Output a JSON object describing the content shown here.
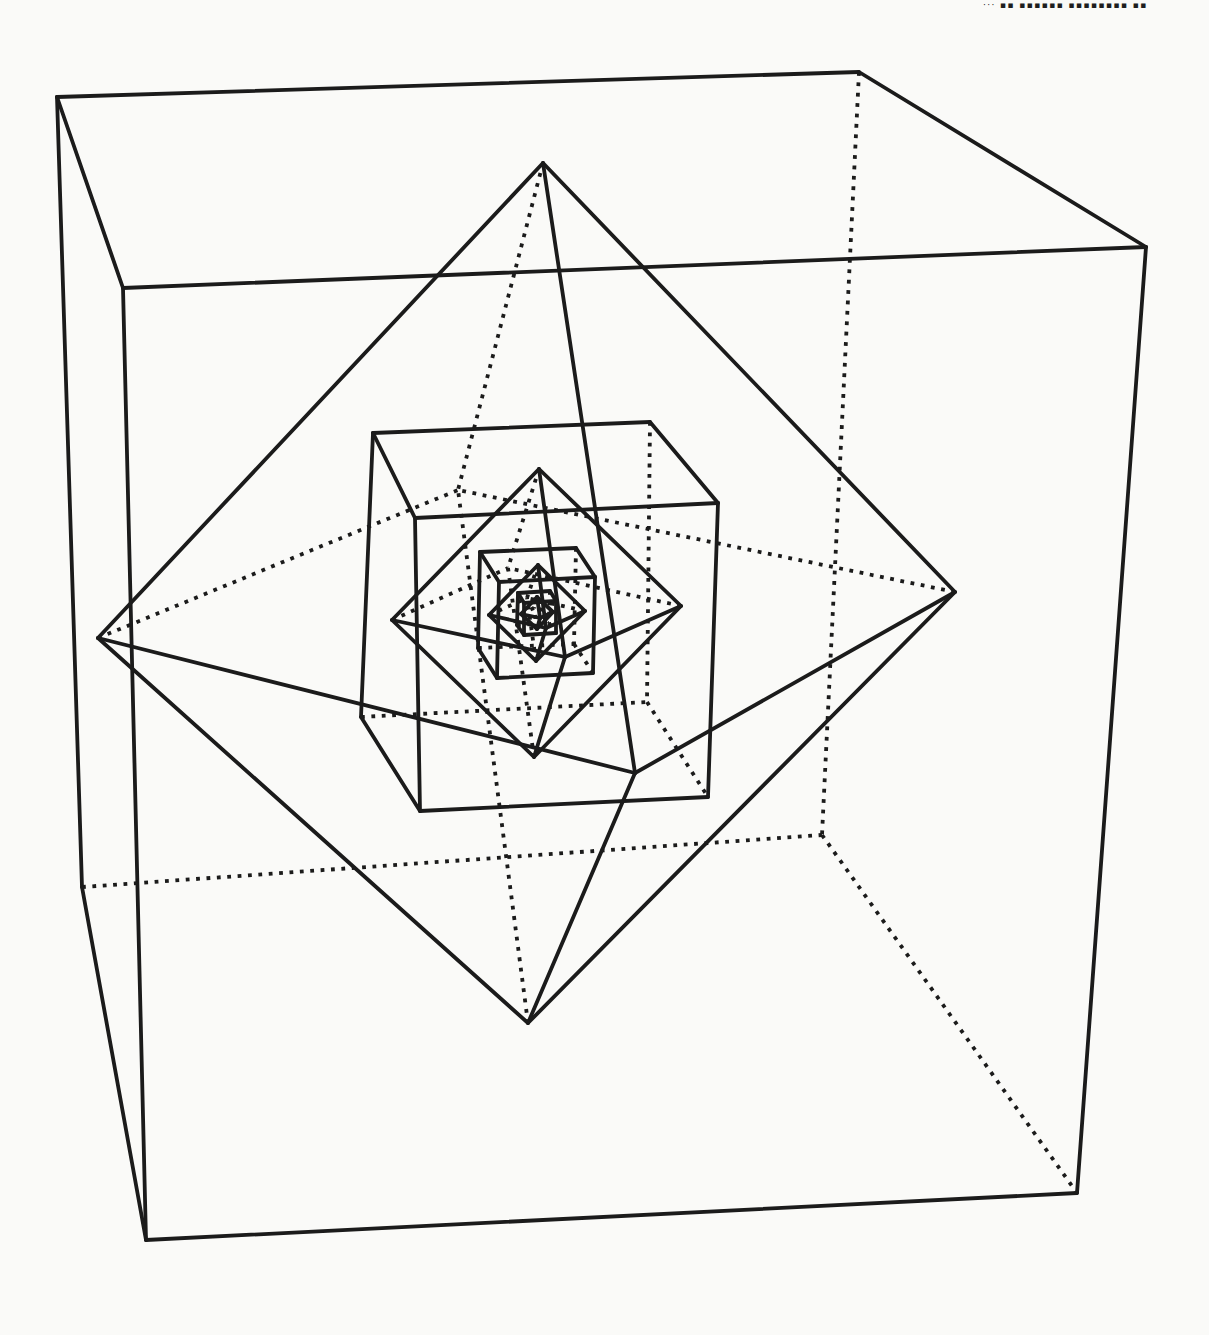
{
  "canvas": {
    "width": 1209,
    "height": 1335
  },
  "page": {
    "background": "#fafaf8",
    "line_color": "#1b1b1b",
    "cropped_text_fragment": "··· ▪▪ ▪▪▪▪▪▪ ▪▪▪▪▪▪▪▪ ▪▪"
  },
  "figure": {
    "topology": {
      "cube": {
        "solid": [
          [
            "BTL",
            "BTR"
          ],
          [
            "BTR",
            "FTR"
          ],
          [
            "FTR",
            "FTL"
          ],
          [
            "FTL",
            "BTL"
          ],
          [
            "BTL",
            "BBL"
          ],
          [
            "FTL",
            "FBL"
          ],
          [
            "FTR",
            "FBR"
          ],
          [
            "BBL",
            "FBL"
          ],
          [
            "FBL",
            "FBR"
          ]
        ],
        "dotted": [
          [
            "BTR",
            "BBR"
          ],
          [
            "BBL",
            "BBR"
          ],
          [
            "BBR",
            "FBR"
          ]
        ]
      },
      "octahedron": {
        "solid": [
          [
            "T",
            "L"
          ],
          [
            "T",
            "R"
          ],
          [
            "T",
            "F"
          ],
          [
            "B",
            "L"
          ],
          [
            "B",
            "R"
          ],
          [
            "B",
            "F"
          ],
          [
            "L",
            "F"
          ],
          [
            "F",
            "R"
          ]
        ],
        "dotted": [
          [
            "T",
            "K"
          ],
          [
            "B",
            "K"
          ],
          [
            "L",
            "K"
          ],
          [
            "R",
            "K"
          ]
        ]
      }
    },
    "shapes": [
      {
        "name": "outer-cube",
        "type": "cube",
        "vertices": {
          "BTL": [
            57,
            97
          ],
          "BTR": [
            859,
            72
          ],
          "FTR": [
            1146,
            247
          ],
          "FTL": [
            123,
            288
          ],
          "BBL": [
            82,
            887
          ],
          "BBR": [
            822,
            835
          ],
          "FBR": [
            1077,
            1193
          ],
          "FBL": [
            146,
            1240
          ]
        }
      },
      {
        "name": "outer-octahedron",
        "type": "octahedron",
        "vertices": {
          "T": [
            543,
            163
          ],
          "B": [
            528,
            1023
          ],
          "L": [
            98,
            638
          ],
          "R": [
            955,
            592
          ],
          "F": [
            635,
            773
          ],
          "K": [
            458,
            490
          ]
        }
      },
      {
        "name": "middle-cube",
        "type": "cube",
        "vertices": {
          "BTL": [
            373,
            433
          ],
          "BTR": [
            650,
            422
          ],
          "FTR": [
            718,
            503
          ],
          "FTL": [
            415,
            518
          ],
          "BBL": [
            361,
            717
          ],
          "BBR": [
            647,
            702
          ],
          "FBR": [
            708,
            797
          ],
          "FBL": [
            420,
            811
          ]
        }
      },
      {
        "name": "middle-octahedron",
        "type": "octahedron",
        "vertices": {
          "T": [
            539,
            469
          ],
          "B": [
            534,
            757
          ],
          "L": [
            392,
            620
          ],
          "R": [
            681,
            606
          ],
          "F": [
            565,
            657
          ],
          "K": [
            508,
            568
          ]
        }
      },
      {
        "name": "small-cube",
        "type": "cube",
        "vertices": {
          "BTL": [
            480,
            552
          ],
          "BTR": [
            576,
            548
          ],
          "FTR": [
            595,
            577
          ],
          "FTL": [
            499,
            582
          ],
          "BBL": [
            478,
            648
          ],
          "BBR": [
            574,
            644
          ],
          "FBR": [
            593,
            673
          ],
          "FBL": [
            497,
            678
          ]
        }
      },
      {
        "name": "small-octahedron",
        "type": "octahedron",
        "vertices": {
          "T": [
            538,
            565
          ],
          "B": [
            536,
            661
          ],
          "L": [
            489,
            615
          ],
          "R": [
            585,
            611
          ],
          "F": [
            546,
            628
          ],
          "K": [
            527,
            598
          ]
        }
      },
      {
        "name": "tiny-cube",
        "type": "cube",
        "vertices": {
          "BTL": [
            518,
            593
          ],
          "BTR": [
            550,
            591
          ],
          "FTR": [
            556,
            601
          ],
          "FTL": [
            524,
            603
          ],
          "BBL": [
            517,
            625
          ],
          "BBR": [
            549,
            623
          ],
          "FBR": [
            556,
            633
          ],
          "FBL": [
            524,
            635
          ]
        }
      },
      {
        "name": "tiny-octahedron",
        "type": "octahedron",
        "vertices": {
          "T": [
            537,
            597
          ],
          "B": [
            537,
            629
          ],
          "L": [
            521,
            614
          ],
          "R": [
            553,
            612
          ],
          "F": [
            540,
            618
          ],
          "K": [
            534,
            608
          ]
        }
      }
    ]
  }
}
